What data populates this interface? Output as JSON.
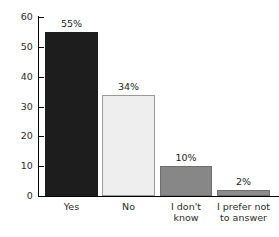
{
  "chart_data": {
    "type": "bar",
    "title": "",
    "subtitle": "",
    "xlabel": "",
    "ylabel": "",
    "categories": [
      "Yes",
      "No",
      "I don't\nknow",
      "I prefer not\nto answer"
    ],
    "values": [
      55,
      34,
      10,
      2
    ],
    "data_labels": [
      "55%",
      "34%",
      "10%",
      "2%"
    ],
    "ylim": [
      0,
      60
    ],
    "yticks": [
      0,
      10,
      20,
      30,
      40,
      50,
      60
    ],
    "ytick_labels": [
      "0",
      "10",
      "20",
      "30",
      "40",
      "50",
      "60"
    ],
    "grid": false,
    "legend": false,
    "bar_colors": [
      "#1d1d1d",
      "#eeeeee",
      "#878787",
      "#8d8d8d"
    ],
    "bar_border_colors": [
      "#1d1d1d",
      "#9a9a9a",
      "#6f6f6f",
      "#6f6f6f"
    ],
    "axis_color": "#000000",
    "background": "#ffffff"
  }
}
